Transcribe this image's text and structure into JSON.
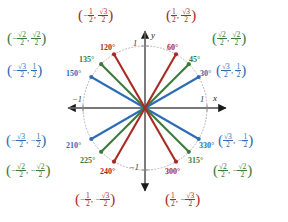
{
  "figure": {
    "type": "unit-circle-diagram",
    "center": {
      "x": 145,
      "y": 108
    },
    "radius": 62,
    "colors": {
      "blue": "#2d6cb5",
      "green": "#3c7a3c",
      "red": "#a82a25",
      "circle": "#b9b0ae",
      "axis": "#6f6f6f",
      "background": "#ffffff"
    }
  },
  "axes": {
    "x_name": "x",
    "y_name": "y",
    "x_tick_pos": "1",
    "x_tick_neg": "−1",
    "y_tick_pos": "1",
    "y_tick_neg": "−1"
  },
  "chart_data": {
    "type": "scatter",
    "xlabel": "x",
    "ylabel": "y",
    "xlim": [
      -1.25,
      1.25
    ],
    "ylim": [
      -1.25,
      1.25
    ],
    "grid": false,
    "legend": null,
    "series": [
      {
        "name": "30-degree family",
        "color": "#2d6cb5",
        "points": [
          {
            "angle_deg": 30,
            "angle_label": "30°",
            "x": 0.866,
            "y": 0.5
          },
          {
            "angle_deg": 150,
            "angle_label": "150°",
            "x": -0.866,
            "y": 0.5
          },
          {
            "angle_deg": 210,
            "angle_label": "210°",
            "x": -0.866,
            "y": -0.5
          },
          {
            "angle_deg": 330,
            "angle_label": "330°",
            "x": 0.866,
            "y": -0.5
          }
        ]
      },
      {
        "name": "45-degree family",
        "color": "#3c7a3c",
        "points": [
          {
            "angle_deg": 45,
            "angle_label": "45°",
            "x": 0.7071,
            "y": 0.7071
          },
          {
            "angle_deg": 135,
            "angle_label": "135°",
            "x": -0.7071,
            "y": 0.7071
          },
          {
            "angle_deg": 225,
            "angle_label": "225°",
            "x": -0.7071,
            "y": -0.7071
          },
          {
            "angle_deg": 315,
            "angle_label": "315°",
            "x": 0.7071,
            "y": -0.7071
          }
        ]
      },
      {
        "name": "60-degree family",
        "color": "#a82a25",
        "points": [
          {
            "angle_deg": 60,
            "angle_label": "60°",
            "x": 0.5,
            "y": 0.866
          },
          {
            "angle_deg": 120,
            "angle_label": "120°",
            "x": -0.5,
            "y": 0.866
          },
          {
            "angle_deg": 240,
            "angle_label": "240°",
            "x": -0.5,
            "y": -0.866
          },
          {
            "angle_deg": 300,
            "angle_label": "300°",
            "x": 0.5,
            "y": -0.866
          }
        ]
      }
    ]
  },
  "degree_labels": {
    "d30": "30°",
    "d45": "45°",
    "d60": "60°",
    "d120": "120°",
    "d135": "135°",
    "d150": "150°",
    "d210": "210°",
    "d225": "225°",
    "d240": "240°",
    "d300": "300°",
    "d315": "315°",
    "d330": "330°"
  },
  "coords": {
    "c60": {
      "x_num": "1",
      "x_den": "2",
      "x_sign": "",
      "y_num": "√3",
      "y_den": "2",
      "y_sign": "",
      "color": "red"
    },
    "c45": {
      "x_num": "√2",
      "x_den": "2",
      "x_sign": "",
      "y_num": "√2",
      "y_den": "2",
      "y_sign": "",
      "color": "green"
    },
    "c30": {
      "x_num": "√3",
      "x_den": "2",
      "x_sign": "",
      "y_num": "1",
      "y_den": "2",
      "y_sign": "",
      "color": "blue"
    },
    "c120": {
      "x_num": "1",
      "x_den": "2",
      "x_sign": "−",
      "y_num": "√3",
      "y_den": "2",
      "y_sign": "",
      "color": "red"
    },
    "c135": {
      "x_num": "√2",
      "x_den": "2",
      "x_sign": "−",
      "y_num": "√2",
      "y_den": "2",
      "y_sign": "",
      "color": "green"
    },
    "c150": {
      "x_num": "√3",
      "x_den": "2",
      "x_sign": "−",
      "y_num": "1",
      "y_den": "2",
      "y_sign": "",
      "color": "blue"
    },
    "c210": {
      "x_num": "√3",
      "x_den": "2",
      "x_sign": "−",
      "y_num": "1",
      "y_den": "2",
      "y_sign": "−",
      "color": "blue"
    },
    "c225": {
      "x_num": "√2",
      "x_den": "2",
      "x_sign": "−",
      "y_num": "√2",
      "y_den": "2",
      "y_sign": "−",
      "color": "green"
    },
    "c240": {
      "x_num": "1",
      "x_den": "2",
      "x_sign": "−",
      "y_num": "√3",
      "y_den": "2",
      "y_sign": "−",
      "color": "red"
    },
    "c300": {
      "x_num": "1",
      "x_den": "2",
      "x_sign": "",
      "y_num": "√3",
      "y_den": "2",
      "y_sign": "−",
      "color": "red"
    },
    "c315": {
      "x_num": "√2",
      "x_den": "2",
      "x_sign": "",
      "y_num": "√2",
      "y_den": "2",
      "y_sign": "−",
      "color": "green"
    },
    "c330": {
      "x_num": "√3",
      "x_den": "2",
      "x_sign": "",
      "y_num": "1",
      "y_den": "2",
      "y_sign": "−",
      "color": "blue"
    }
  }
}
